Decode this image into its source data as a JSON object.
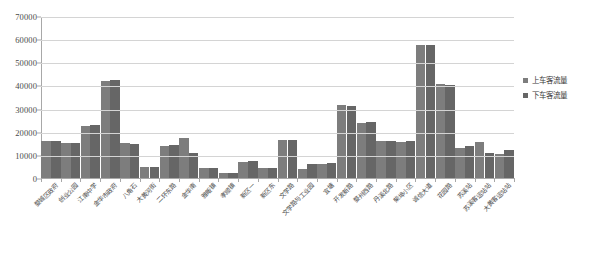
{
  "chart_data": {
    "type": "bar",
    "title": "",
    "xlabel": "",
    "ylabel": "",
    "ylim": [
      0,
      70000
    ],
    "y_ticks": [
      0,
      10000,
      20000,
      30000,
      40000,
      50000,
      60000,
      70000
    ],
    "grid": true,
    "legend_position": "right",
    "categories": [
      "婺城区政府",
      "创业公园",
      "江南中学",
      "金华市政府",
      "八角石",
      "大黄河街",
      "二环东路",
      "金华南",
      "雅畈镇",
      "孝顺镇",
      "新区一",
      "新区东",
      "文学路",
      "文学路与工业园",
      "宜塘",
      "开发新路",
      "婺州西路",
      "丹溪北路",
      "柴埠小区",
      "诚信大道",
      "花园路",
      "苏溪站",
      "苏溪客运站站",
      "大黄客运站站"
    ],
    "series": [
      {
        "name": "上车客流量",
        "color": "#7d7d7d",
        "values": [
          16000,
          15300,
          22500,
          41800,
          15000,
          4700,
          13800,
          17300,
          4300,
          2100,
          7100,
          4200,
          16500,
          3800,
          6100,
          31500,
          23900,
          16000,
          15600,
          57500,
          40500,
          13000,
          15500,
          10500
        ]
      },
      {
        "name": "下车客流量",
        "color": "#666666",
        "values": [
          16200,
          15200,
          22700,
          42200,
          14800,
          4900,
          14100,
          10900,
          4400,
          2200,
          7500,
          4300,
          16300,
          6200,
          6400,
          31200,
          24000,
          15800,
          16100,
          57300,
          40400,
          13800,
          10700,
          11900
        ]
      }
    ]
  },
  "legend": {
    "items": [
      {
        "label": "上车客流量",
        "color": "#7d7d7d"
      },
      {
        "label": "下车客流量",
        "color": "#666666"
      }
    ]
  }
}
